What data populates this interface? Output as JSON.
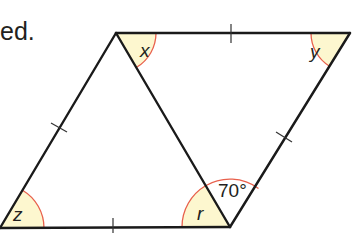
{
  "caption": "ed.",
  "colors": {
    "line": "#1a1a1a",
    "arc": "#e8604c",
    "fill": "#fdf7cf",
    "text": "#231f20"
  },
  "vertices": {
    "A_top_left": [
      116,
      33
    ],
    "B_top_right": [
      350,
      33
    ],
    "C_bottom_left": [
      0,
      228
    ],
    "D_bottom_mid": [
      230,
      227
    ]
  },
  "angles": [
    {
      "id": "x",
      "label": "x",
      "vertex": "A_top_left",
      "shaded": true
    },
    {
      "id": "y",
      "label": "y",
      "vertex": "B_top_right",
      "shaded": true
    },
    {
      "id": "z",
      "label": "z",
      "vertex": "C_bottom_left",
      "shaded": true
    },
    {
      "id": "r",
      "label": "r",
      "vertex": "D_bottom_mid",
      "shaded": true
    },
    {
      "id": "given",
      "label": "70°",
      "vertex": "D_bottom_mid",
      "shaded": false
    }
  ],
  "equal_length_marks": [
    "top edge",
    "left edge",
    "bottom edge",
    "right edge"
  ]
}
